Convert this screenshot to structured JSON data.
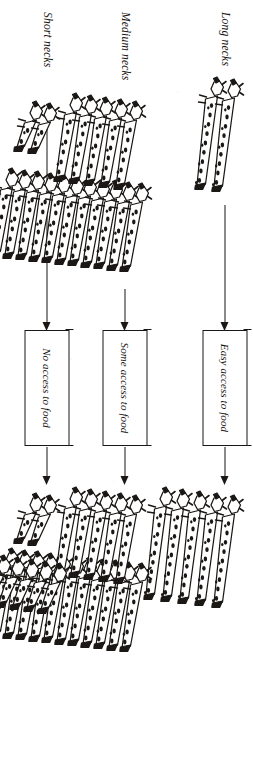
{
  "diagram": {
    "orientation": "rotated-90-ccw",
    "ink_color": "#1a1714",
    "paper_color": "#ffffff"
  },
  "rows": [
    {
      "id": "long",
      "neck_label": "Long necks",
      "food_label": "Easy access to food",
      "before_count": 2,
      "after_count": 5,
      "neck_length": "long"
    },
    {
      "id": "medium",
      "neck_label": "Medium necks",
      "food_label": "Some access to food",
      "before_count": 5,
      "after_count": 5,
      "neck_length": "medium"
    },
    {
      "id": "short",
      "neck_label": "Short necks",
      "food_label": "No access to food",
      "before_count": 2,
      "after_count": 2,
      "neck_length": "short"
    }
  ],
  "center_column": {
    "before_count": 11,
    "after_count": 11,
    "neck_length": "medium"
  },
  "labels": {
    "long_necks": "Long necks",
    "medium_necks": "Medium necks",
    "short_necks": "Short necks",
    "easy_access": "Easy access to food",
    "some_access": "Some access to food",
    "no_access": "No access to food"
  }
}
